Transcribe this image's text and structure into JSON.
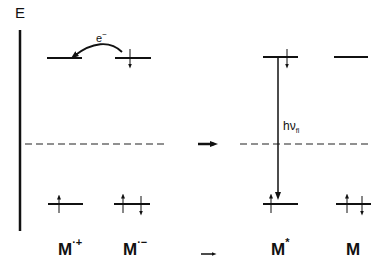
{
  "diagram": {
    "axis_label": "E",
    "electron_transfer_label": "e",
    "electron_transfer_superscript": "−",
    "fluorescence_label": "hν",
    "fluorescence_subscript": "fl",
    "reaction_arrow": "→",
    "species": [
      {
        "name": "M",
        "superscript": "·+"
      },
      {
        "name": "M",
        "superscript": "·−"
      },
      {
        "name": "M",
        "superscript": "*"
      },
      {
        "name": "M",
        "superscript": ""
      }
    ],
    "levels": {
      "M_radical_cation": {
        "upper": "empty",
        "lower": "one electron (up)"
      },
      "M_radical_anion": {
        "upper": "one electron (down)",
        "lower": "two electrons (up, down)"
      },
      "M_excited": {
        "upper": "one electron (down)",
        "lower": "one electron (up)"
      },
      "M_ground": {
        "upper": "empty",
        "lower": "two electrons (up, down)"
      }
    },
    "colors": {
      "ink": "#111111",
      "background": "#ffffff"
    }
  }
}
